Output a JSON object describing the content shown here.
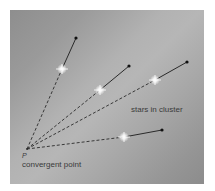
{
  "diagram": {
    "title": "",
    "labels": {
      "cluster": "stars in cluster",
      "point_letter": "P",
      "convergent": "convergent point"
    },
    "colors": {
      "background_dark": "#8e8e8e",
      "background_light": "#b6b6b6",
      "line": "#2a2a2a",
      "star": "#ffffff",
      "text": "#3a3a3a"
    },
    "convergent_point": {
      "x": 27,
      "y": 149
    },
    "rays": [
      {
        "star": {
          "x": 62,
          "y": 69
        },
        "arrow_tip": {
          "x": 76,
          "y": 38
        }
      },
      {
        "star": {
          "x": 100,
          "y": 90
        },
        "arrow_tip": {
          "x": 129,
          "y": 66
        }
      },
      {
        "star": {
          "x": 155,
          "y": 80
        },
        "arrow_tip": {
          "x": 187,
          "y": 62
        }
      },
      {
        "star": {
          "x": 124,
          "y": 137
        },
        "arrow_tip": {
          "x": 162,
          "y": 130
        }
      }
    ]
  }
}
